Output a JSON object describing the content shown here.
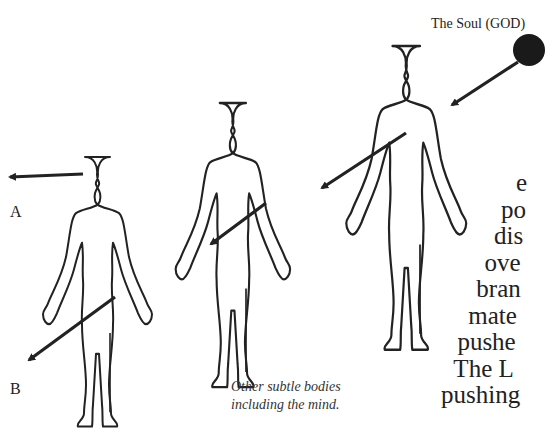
{
  "diagram": {
    "soul_label": "The Soul (GOD)",
    "label_a": "A",
    "label_b": "B",
    "caption_lines": [
      "Other subtle bodies",
      "including the mind."
    ],
    "text_fragment_lines": [
      "e",
      "po",
      "dis",
      "ove",
      "bran",
      "mate",
      "pushe",
      "The L",
      "pushing"
    ],
    "figures": [
      {
        "name": "left-body",
        "label": "physical body A/B"
      },
      {
        "name": "middle-body",
        "label": "subtle body"
      },
      {
        "name": "right-body",
        "label": "subtle body near soul"
      }
    ],
    "colors": {
      "ink": "#222222",
      "soul": "#1a1a1a"
    }
  }
}
